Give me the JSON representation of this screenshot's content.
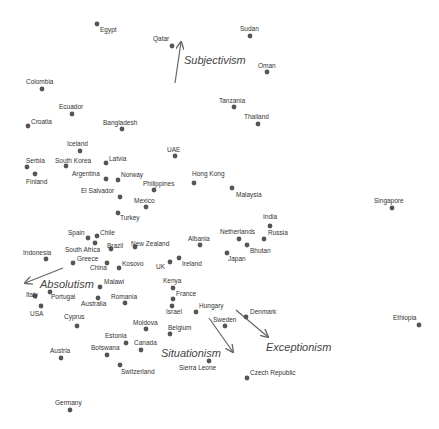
{
  "chart_data": {
    "type": "scatter",
    "title": "",
    "xlabel": "",
    "ylabel": "",
    "grid": false,
    "legend": "none",
    "point_color": "#555555",
    "arrow_color": "#666666",
    "points": [
      {
        "label": "Egypt",
        "x": 97,
        "y": 24,
        "lx": 100,
        "ly": 32
      },
      {
        "label": "Qatar",
        "x": 172,
        "y": 46,
        "lx": 153,
        "ly": 41
      },
      {
        "label": "Sudan",
        "x": 250,
        "y": 36,
        "lx": 240,
        "ly": 31
      },
      {
        "label": "Oman",
        "x": 267,
        "y": 72,
        "lx": 258,
        "ly": 68
      },
      {
        "label": "Colombia",
        "x": 42,
        "y": 89,
        "lx": 26,
        "ly": 84
      },
      {
        "label": "Ecuador",
        "x": 72,
        "y": 114,
        "lx": 59,
        "ly": 109
      },
      {
        "label": "Tanzania",
        "x": 234,
        "y": 107,
        "lx": 219,
        "ly": 103
      },
      {
        "label": "Thailand",
        "x": 258,
        "y": 124,
        "lx": 244,
        "ly": 119
      },
      {
        "label": "Croatia",
        "x": 28,
        "y": 126,
        "lx": 31,
        "ly": 124
      },
      {
        "label": "Bangladesh",
        "x": 122,
        "y": 129,
        "lx": 103,
        "ly": 125
      },
      {
        "label": "Iceland",
        "x": 80,
        "y": 151,
        "lx": 67,
        "ly": 146
      },
      {
        "label": "UAE",
        "x": 175,
        "y": 156,
        "lx": 167,
        "ly": 152
      },
      {
        "label": "Serbia",
        "x": 27,
        "y": 167,
        "lx": 26,
        "ly": 163
      },
      {
        "label": "South Korea",
        "x": 66,
        "y": 166,
        "lx": 55,
        "ly": 163
      },
      {
        "label": "Latvia",
        "x": 106,
        "y": 163,
        "lx": 109,
        "ly": 161
      },
      {
        "label": "Finland",
        "x": 35,
        "y": 174,
        "lx": 26,
        "ly": 184
      },
      {
        "label": "Argentina",
        "x": 106,
        "y": 179,
        "lx": 72,
        "ly": 176
      },
      {
        "label": "Norway",
        "x": 118,
        "y": 180,
        "lx": 121,
        "ly": 177
      },
      {
        "label": "Hong Kong",
        "x": 194,
        "y": 183,
        "lx": 192,
        "ly": 176
      },
      {
        "label": "Philippines",
        "x": 154,
        "y": 190,
        "lx": 143,
        "ly": 186
      },
      {
        "label": "Malaysia",
        "x": 232,
        "y": 188,
        "lx": 236,
        "ly": 197
      },
      {
        "label": "El Salvador",
        "x": 120,
        "y": 197,
        "lx": 81,
        "ly": 193
      },
      {
        "label": "Mexico",
        "x": 146,
        "y": 207,
        "lx": 134,
        "ly": 203
      },
      {
        "label": "Turkey",
        "x": 118,
        "y": 213,
        "lx": 120,
        "ly": 220
      },
      {
        "label": "Singapore",
        "x": 392,
        "y": 208,
        "lx": 374,
        "ly": 203
      },
      {
        "label": "India",
        "x": 270,
        "y": 226,
        "lx": 263,
        "ly": 219
      },
      {
        "label": "Spain",
        "x": 88,
        "y": 238,
        "lx": 68,
        "ly": 235
      },
      {
        "label": "Chile",
        "x": 97,
        "y": 236,
        "lx": 100,
        "ly": 235
      },
      {
        "label": "Netherlands",
        "x": 239,
        "y": 239,
        "lx": 220,
        "ly": 234
      },
      {
        "label": "Russia",
        "x": 264,
        "y": 239,
        "lx": 268,
        "ly": 235
      },
      {
        "label": "Albania",
        "x": 200,
        "y": 245,
        "lx": 188,
        "ly": 241
      },
      {
        "label": "Bhutan",
        "x": 247,
        "y": 245,
        "lx": 250,
        "ly": 253
      },
      {
        "label": "Brazil",
        "x": 111,
        "y": 249,
        "lx": 107,
        "ly": 248
      },
      {
        "label": "New Zealand",
        "x": 135,
        "y": 247,
        "lx": 131,
        "ly": 246
      },
      {
        "label": "Indonesia",
        "x": 46,
        "y": 259,
        "lx": 23,
        "ly": 255
      },
      {
        "label": "South Africa",
        "x": 95,
        "y": 243,
        "lx": 65,
        "ly": 252
      },
      {
        "label": "Greece",
        "x": 73,
        "y": 263,
        "lx": 77,
        "ly": 261
      },
      {
        "label": "China",
        "x": 107,
        "y": 263,
        "lx": 90,
        "ly": 270
      },
      {
        "label": "Japan",
        "x": 227,
        "y": 253,
        "lx": 228,
        "ly": 261
      },
      {
        "label": "Kosovo",
        "x": 119,
        "y": 268,
        "lx": 122,
        "ly": 266
      },
      {
        "label": "UK",
        "x": 170,
        "y": 262,
        "lx": 156,
        "ly": 269
      },
      {
        "label": "Ireland",
        "x": 179,
        "y": 258,
        "lx": 182,
        "ly": 266
      },
      {
        "label": "Malawi",
        "x": 100,
        "y": 287,
        "lx": 104,
        "ly": 284
      },
      {
        "label": "Kenya",
        "x": 173,
        "y": 288,
        "lx": 163,
        "ly": 283
      },
      {
        "label": "Italy",
        "x": 35,
        "y": 296,
        "lx": 26,
        "ly": 297
      },
      {
        "label": "Portugal",
        "x": 50,
        "y": 292,
        "lx": 51,
        "ly": 299
      },
      {
        "label": "France",
        "x": 173,
        "y": 299,
        "lx": 176,
        "ly": 296
      },
      {
        "label": "USA",
        "x": 41,
        "y": 306,
        "lx": 30,
        "ly": 316
      },
      {
        "label": "Australia",
        "x": 98,
        "y": 298,
        "lx": 81,
        "ly": 306
      },
      {
        "label": "Romania",
        "x": 125,
        "y": 303,
        "lx": 111,
        "ly": 299
      },
      {
        "label": "Israel",
        "x": 172,
        "y": 306,
        "lx": 166,
        "ly": 314
      },
      {
        "label": "Hungary",
        "x": 196,
        "y": 312,
        "lx": 199,
        "ly": 308
      },
      {
        "label": "Denmark",
        "x": 246,
        "y": 317,
        "lx": 250,
        "ly": 314
      },
      {
        "label": "Sweden",
        "x": 225,
        "y": 326,
        "lx": 213,
        "ly": 322
      },
      {
        "label": "Cyprus",
        "x": 77,
        "y": 326,
        "lx": 64,
        "ly": 319
      },
      {
        "label": "Moldova",
        "x": 146,
        "y": 329,
        "lx": 133,
        "ly": 325
      },
      {
        "label": "Belgium",
        "x": 170,
        "y": 334,
        "lx": 168,
        "ly": 330
      },
      {
        "label": "Estonia",
        "x": 126,
        "y": 343,
        "lx": 105,
        "ly": 338
      },
      {
        "label": "Canada",
        "x": 141,
        "y": 350,
        "lx": 134,
        "ly": 345
      },
      {
        "label": "Botswana",
        "x": 107,
        "y": 355,
        "lx": 91,
        "ly": 350
      },
      {
        "label": "Austria",
        "x": 61,
        "y": 358,
        "lx": 50,
        "ly": 353
      },
      {
        "label": "Sierra Leone",
        "x": 209,
        "y": 361,
        "lx": 179,
        "ly": 370
      },
      {
        "label": "Switzerland",
        "x": 120,
        "y": 365,
        "lx": 121,
        "ly": 374
      },
      {
        "label": "Czech Republic",
        "x": 247,
        "y": 378,
        "lx": 250,
        "ly": 375
      },
      {
        "label": "Ethiopia",
        "x": 419,
        "y": 325,
        "lx": 393,
        "ly": 320
      },
      {
        "label": "Germany",
        "x": 70,
        "y": 410,
        "lx": 55,
        "ly": 405
      }
    ],
    "vectors": [
      {
        "label": "Subjectivism",
        "x1": 175,
        "y1": 83,
        "x2": 181,
        "y2": 42,
        "lx": 184,
        "ly": 64
      },
      {
        "label": "Absolutism",
        "x1": 63,
        "y1": 268,
        "x2": 25,
        "y2": 283,
        "lx": 40,
        "ly": 288
      },
      {
        "label": "Situationism",
        "x1": 209,
        "y1": 318,
        "x2": 233,
        "y2": 352,
        "lx": 161,
        "ly": 357
      },
      {
        "label": "Exceptionism",
        "x1": 236,
        "y1": 310,
        "x2": 268,
        "y2": 337,
        "lx": 266,
        "ly": 351
      }
    ]
  }
}
